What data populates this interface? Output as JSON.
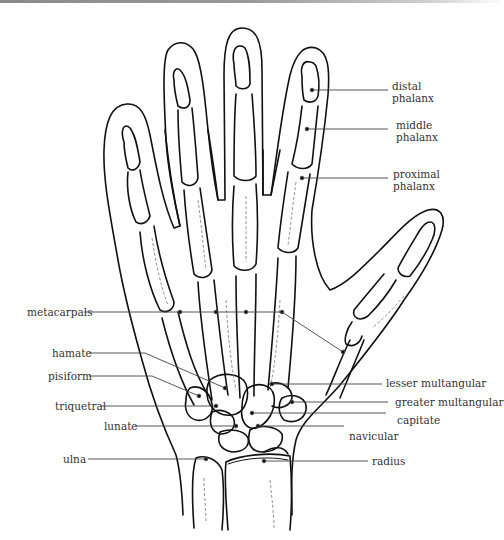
{
  "diagram": {
    "labels_right": [
      {
        "id": "distal-phalanx",
        "line1": "distal",
        "line2": "phalanx"
      },
      {
        "id": "middle-phalanx",
        "line1": "middle",
        "line2": "phalanx"
      },
      {
        "id": "proximal-phalanx",
        "line1": "proximal",
        "line2": "phalanx"
      },
      {
        "id": "lesser-multangular",
        "line1": "lesser multangular"
      },
      {
        "id": "greater-multangular",
        "line1": "greater multangular"
      },
      {
        "id": "capitate",
        "line1": "capitate"
      },
      {
        "id": "navicular",
        "line1": "navicular"
      },
      {
        "id": "radius",
        "line1": "radius"
      }
    ],
    "labels_left": [
      {
        "id": "metacarpals",
        "line1": "metacarpals"
      },
      {
        "id": "hamate",
        "line1": "hamate"
      },
      {
        "id": "pisiform",
        "line1": "pisiform"
      },
      {
        "id": "triquetral",
        "line1": "triquetral"
      },
      {
        "id": "lunate",
        "line1": "lunate"
      },
      {
        "id": "ulna",
        "line1": "ulna"
      }
    ],
    "line_color": "#111111",
    "leader_color": "#444444",
    "text_color": "#333333"
  }
}
